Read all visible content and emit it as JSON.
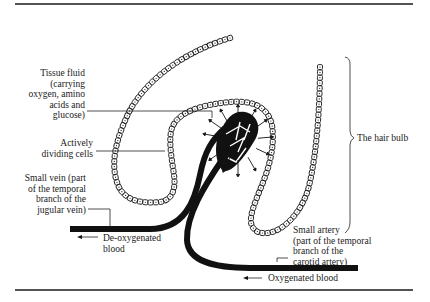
{
  "diagram": {
    "title": "The hair bulb",
    "labels": {
      "tissue_fluid": "Tissue fluid\n(carrying\noxygen, amino\nacids and\nglucose)",
      "dividing_cells": "Actively\ndividing cells",
      "small_vein": "Small vein (part\nof the temporal\nbranch of the\njugular vein)",
      "deoxygenated": "De-oxygenated\nblood",
      "small_artery": "Small artery\n(part of the temporal\nbranch of the\ncarotid artery)",
      "oxygenated": "Oxygenated blood",
      "hair_bulb": "The hair bulb"
    },
    "colors": {
      "ink": "#1a1a1a",
      "background": "#ffffff"
    }
  }
}
